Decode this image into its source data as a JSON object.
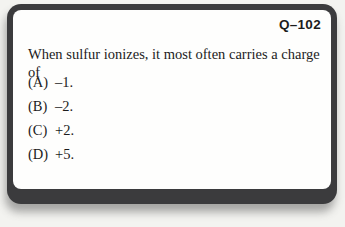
{
  "card": {
    "id_label": "Q–102",
    "question": "When sulfur ionizes, it most often carries a charge of",
    "options": [
      {
        "letter": "(A)",
        "text": "–1."
      },
      {
        "letter": "(B)",
        "text": "–2."
      },
      {
        "letter": "(C)",
        "text": "+2."
      },
      {
        "letter": "(D)",
        "text": "+5."
      }
    ],
    "colors": {
      "frame": "#3b3b3d",
      "card_face": "#fefefd",
      "text": "#1c1c1c",
      "background": "#f3f3f0"
    }
  }
}
